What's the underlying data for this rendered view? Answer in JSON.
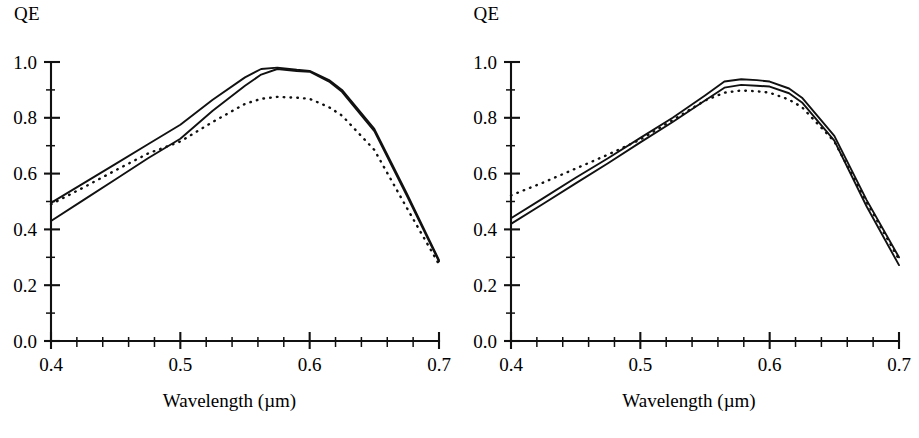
{
  "figure": {
    "panel_count": 2,
    "background_color": "#ffffff",
    "ink_color": "#111111"
  },
  "panels": [
    {
      "name": "left",
      "y_axis_title": "QE",
      "x_axis_title": "Wavelength (µm)",
      "y_ticklabels": [
        "0.0",
        "0.2",
        "0.4",
        "0.6",
        "0.8",
        "1.0"
      ],
      "x_ticklabels": [
        "0.4",
        "0.5",
        "0.6",
        "0.7"
      ]
    },
    {
      "name": "right",
      "y_axis_title": "QE",
      "x_axis_title": "Wavelength (µm)",
      "y_ticklabels": [
        "0.0",
        "0.2",
        "0.4",
        "0.6",
        "0.8",
        "1.0"
      ],
      "x_ticklabels": [
        "0.4",
        "0.5",
        "0.6",
        "0.7"
      ]
    }
  ],
  "chart_data": [
    {
      "type": "line",
      "panel": "left",
      "title": "",
      "xlabel": "Wavelength (µm)",
      "ylabel": "QE",
      "xlim": [
        0.4,
        0.7
      ],
      "ylim": [
        0.0,
        1.0
      ],
      "xticks": [
        0.4,
        0.5,
        0.6,
        0.7
      ],
      "yticks": [
        0.0,
        0.2,
        0.4,
        0.6,
        0.8,
        1.0
      ],
      "xminorticks": [
        0.42,
        0.44,
        0.46,
        0.48,
        0.52,
        0.54,
        0.56,
        0.58,
        0.62,
        0.64,
        0.66,
        0.68
      ],
      "yminorticks": [
        0.1,
        0.3,
        0.5,
        0.7,
        0.9
      ],
      "grid": false,
      "legend_position": "none",
      "x": [
        0.4,
        0.425,
        0.45,
        0.475,
        0.5,
        0.525,
        0.55,
        0.5625,
        0.575,
        0.59,
        0.6,
        0.615,
        0.625,
        0.65,
        0.675,
        0.7
      ],
      "series": [
        {
          "name": "solid-upper",
          "style": "solid",
          "values": [
            0.495,
            0.565,
            0.635,
            0.705,
            0.775,
            0.865,
            0.945,
            0.975,
            0.98,
            0.972,
            0.968,
            0.935,
            0.9,
            0.76,
            0.53,
            0.29
          ]
        },
        {
          "name": "solid-lower",
          "style": "solid",
          "values": [
            0.43,
            0.505,
            0.58,
            0.655,
            0.725,
            0.825,
            0.915,
            0.955,
            0.975,
            0.968,
            0.965,
            0.93,
            0.893,
            0.752,
            0.522,
            0.285
          ]
        },
        {
          "name": "dotted",
          "style": "dotted",
          "values": [
            0.49,
            0.55,
            0.612,
            0.672,
            0.715,
            0.785,
            0.85,
            0.868,
            0.875,
            0.872,
            0.868,
            0.838,
            0.808,
            0.685,
            0.478,
            0.275
          ]
        }
      ]
    },
    {
      "type": "line",
      "panel": "right",
      "title": "",
      "xlabel": "Wavelength (µm)",
      "ylabel": "QE",
      "xlim": [
        0.4,
        0.7
      ],
      "ylim": [
        0.0,
        1.0
      ],
      "xticks": [
        0.4,
        0.5,
        0.6,
        0.7
      ],
      "yticks": [
        0.0,
        0.2,
        0.4,
        0.6,
        0.8,
        1.0
      ],
      "xminorticks": [
        0.42,
        0.44,
        0.46,
        0.48,
        0.52,
        0.54,
        0.56,
        0.58,
        0.62,
        0.64,
        0.66,
        0.68
      ],
      "yminorticks": [
        0.1,
        0.3,
        0.5,
        0.7,
        0.9
      ],
      "grid": false,
      "legend_position": "none",
      "x": [
        0.4,
        0.425,
        0.45,
        0.475,
        0.5,
        0.525,
        0.55,
        0.565,
        0.578,
        0.59,
        0.6,
        0.615,
        0.625,
        0.65,
        0.675,
        0.7
      ],
      "series": [
        {
          "name": "solid-upper",
          "style": "solid",
          "values": [
            0.44,
            0.512,
            0.585,
            0.655,
            0.728,
            0.8,
            0.88,
            0.93,
            0.938,
            0.935,
            0.93,
            0.905,
            0.872,
            0.735,
            0.505,
            0.3
          ]
        },
        {
          "name": "solid-lower",
          "style": "solid",
          "values": [
            0.42,
            0.492,
            0.565,
            0.637,
            0.712,
            0.785,
            0.862,
            0.908,
            0.918,
            0.915,
            0.912,
            0.888,
            0.855,
            0.718,
            0.482,
            0.272
          ]
        },
        {
          "name": "dotted",
          "style": "dotted",
          "values": [
            0.522,
            0.568,
            0.618,
            0.668,
            0.722,
            0.792,
            0.862,
            0.89,
            0.898,
            0.895,
            0.89,
            0.865,
            0.838,
            0.715,
            0.498,
            0.292
          ]
        }
      ]
    }
  ]
}
